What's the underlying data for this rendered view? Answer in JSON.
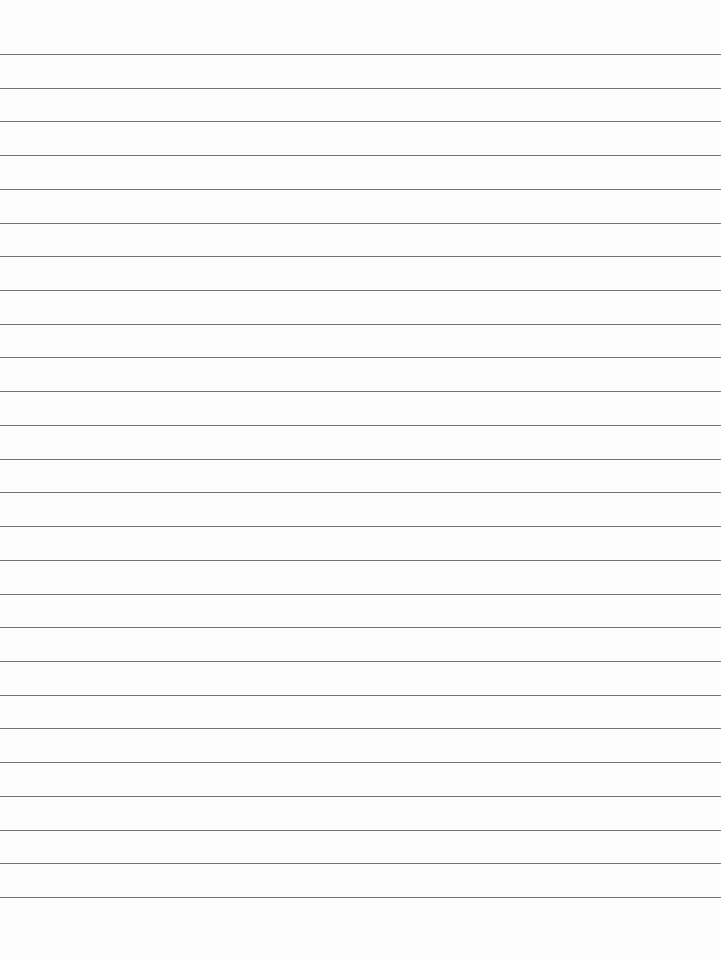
{
  "page": {
    "type": "blank lined paper",
    "background": "#fdfdfd",
    "line_color": "#5a5a5a",
    "line_count": 26,
    "first_line_y": 54,
    "line_spacing": 33.72
  }
}
